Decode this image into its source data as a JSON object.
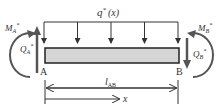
{
  "diagram": {
    "load_label": "q* (x)",
    "load_label_main": "q",
    "load_label_sup": "*",
    "load_label_arg": "(x)",
    "moment_a": {
      "main": "M",
      "sub": "A",
      "sup": "*"
    },
    "shear_a": {
      "main": "Q",
      "sub": "A",
      "sup": "*"
    },
    "moment_b": {
      "main": "M",
      "sub": "B",
      "sup": "*"
    },
    "shear_b": {
      "main": "Q",
      "sub": "B",
      "sup": "*"
    },
    "node_a": "A",
    "node_b": "B",
    "length_label": {
      "main": "l",
      "sub": "AB"
    },
    "coord_label": "x",
    "colors": {
      "beam_fill": "#d6d6d6",
      "stroke": "#333333",
      "arrow": "#555555"
    }
  }
}
